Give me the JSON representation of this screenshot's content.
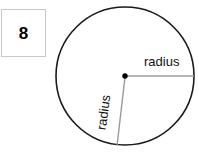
{
  "problem": {
    "number": "8"
  },
  "diagram": {
    "name": "circle-with-two-radii",
    "shape": "circle",
    "center_label": "center-point",
    "labels": {
      "radius_horizontal": "radius",
      "radius_diagonal": "radius"
    },
    "geometry": {
      "center_x": 125,
      "center_y": 76,
      "radius_px": 69,
      "horizontal_radius_end_x": 194,
      "horizontal_radius_end_y": 76,
      "diagonal_radius_end_x": 117,
      "diagonal_radius_end_y": 145
    },
    "colors": {
      "circle_outline": "#1a1a1a",
      "radius_line": "#9a9a9a",
      "center_dot": "#000000",
      "text": "#111111",
      "box_border": "#c9c9c9",
      "background": "#ffffff"
    }
  }
}
